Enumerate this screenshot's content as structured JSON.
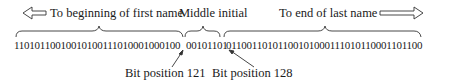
{
  "diagram": {
    "top_labels": {
      "left": "To beginning of first name",
      "middle": "Middle initial",
      "right": "To end of last name"
    },
    "bits": {
      "first_name": "11010110010010100111010001000100",
      "middle_initial": "00101101",
      "last_name": "01100110101100101000111010110001101100"
    },
    "bottom_labels": {
      "pos_a": "Bit position 121",
      "pos_b": "Bit position 128"
    },
    "icons": {
      "left": "left-hollow-arrow-icon",
      "right": "right-hollow-arrow-icon"
    },
    "colors": {
      "ink": "#1a1a1a",
      "background": "#ffffff"
    }
  }
}
